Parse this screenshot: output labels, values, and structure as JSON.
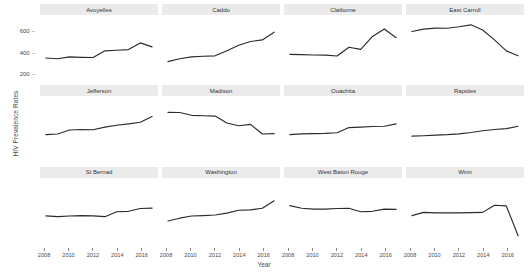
{
  "chart_data": {
    "type": "line",
    "title": "",
    "xlabel": "Year",
    "ylabel": "HIV Prevalence Rates",
    "xlim": [
      2008,
      2017
    ],
    "ylim": [
      150,
      660
    ],
    "yticks": [
      200,
      400,
      600
    ],
    "xticks": [
      2008,
      2010,
      2012,
      2014,
      2016
    ],
    "grid": false,
    "legend": false,
    "facet_layout": {
      "rows": 3,
      "cols": 4
    },
    "x": [
      2008,
      2009,
      2010,
      2011,
      2012,
      2013,
      2014,
      2015,
      2016,
      2017
    ],
    "series": [
      {
        "name": "Avoyelles",
        "values": [
          352,
          345,
          362,
          358,
          356,
          418,
          424,
          430,
          492,
          455
        ]
      },
      {
        "name": "Caddo",
        "values": [
          318,
          345,
          362,
          368,
          372,
          420,
          470,
          505,
          520,
          592
        ]
      },
      {
        "name": "Claiborne",
        "values": [
          386,
          383,
          380,
          378,
          370,
          452,
          432,
          552,
          622,
          540
        ]
      },
      {
        "name": "East Carroll",
        "values": [
          598,
          620,
          630,
          628,
          642,
          660,
          612,
          520,
          418,
          372
        ]
      },
      {
        "name": "Jefferson",
        "values": [
          392,
          398,
          435,
          440,
          438,
          462,
          480,
          492,
          508,
          560
        ]
      },
      {
        "name": "Madison",
        "values": [
          600,
          598,
          572,
          568,
          565,
          500,
          475,
          488,
          398,
          402
        ]
      },
      {
        "name": "Ouachita",
        "values": [
          392,
          400,
          402,
          404,
          410,
          458,
          462,
          468,
          470,
          492
        ]
      },
      {
        "name": "Rapides",
        "values": [
          378,
          382,
          388,
          392,
          400,
          412,
          428,
          440,
          448,
          470
        ]
      },
      {
        "name": "St Bernad",
        "values": [
          400,
          392,
          398,
          402,
          400,
          392,
          438,
          442,
          468,
          472
        ]
      },
      {
        "name": "Washington",
        "values": [
          352,
          378,
          398,
          402,
          408,
          425,
          452,
          455,
          470,
          540
        ]
      },
      {
        "name": "West Baton Rouge",
        "values": [
          495,
          470,
          462,
          462,
          468,
          470,
          438,
          442,
          462,
          460
        ]
      },
      {
        "name": "Winn",
        "values": [
          402,
          432,
          428,
          428,
          428,
          430,
          432,
          498,
          492,
          215
        ]
      }
    ]
  },
  "facets": [
    {
      "title": "Avoyelles"
    },
    {
      "title": "Caddo"
    },
    {
      "title": "Claiborne"
    },
    {
      "title": "East Carroll"
    },
    {
      "title": "Jefferson"
    },
    {
      "title": "Madison"
    },
    {
      "title": "Ouachita"
    },
    {
      "title": "Rapides"
    },
    {
      "title": "St Bernad"
    },
    {
      "title": "Washington"
    },
    {
      "title": "West Baton Rouge"
    },
    {
      "title": "Winn"
    }
  ],
  "axis": {
    "y_label": "HIV Prevalence Rates",
    "x_label": "Year",
    "y_tick_labels": [
      "600",
      "400",
      "200"
    ],
    "x_tick_labels": [
      "2008",
      "2010",
      "2012",
      "2014",
      "2016"
    ]
  },
  "colors": {
    "line": "#2b2b2b",
    "strip_bg": "#ebebeb",
    "panel_bg": "#ffffff",
    "text": "#4a4a4a"
  }
}
